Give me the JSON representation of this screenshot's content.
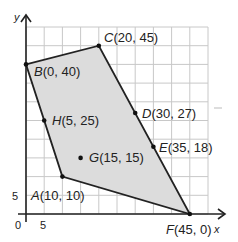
{
  "chart_data": {
    "type": "scatter",
    "title": "",
    "xlabel": "x",
    "ylabel": "y",
    "xlim": [
      0,
      50
    ],
    "ylim": [
      0,
      50
    ],
    "grid": true,
    "grid_step": 5,
    "tick_labels": {
      "x": [
        "0",
        "5"
      ],
      "y": [
        "5"
      ]
    },
    "polygon": {
      "vertices": [
        "A",
        "B",
        "C",
        "F"
      ],
      "fill": "#dcdcdc",
      "stroke": "#222222"
    },
    "points": [
      {
        "name": "A",
        "x": 10,
        "y": 10,
        "label": "A(10, 10)"
      },
      {
        "name": "B",
        "x": 0,
        "y": 40,
        "label": "B(0, 40)"
      },
      {
        "name": "C",
        "x": 20,
        "y": 45,
        "label": "C(20, 45)"
      },
      {
        "name": "D",
        "x": 30,
        "y": 27,
        "label": "D(30, 27)"
      },
      {
        "name": "E",
        "x": 35,
        "y": 18,
        "label": "E(35, 18)"
      },
      {
        "name": "F",
        "x": 45,
        "y": 0,
        "label": "F(45, 0)"
      },
      {
        "name": "G",
        "x": 15,
        "y": 15,
        "label": "G(15, 15)"
      },
      {
        "name": "H",
        "x": 5,
        "y": 25,
        "label": "H(5, 25)"
      }
    ]
  },
  "axes": {
    "x_label": "x",
    "y_label": "y",
    "origin_label": "0",
    "x_tick_5": "5",
    "y_tick_5": "5"
  },
  "labels": {
    "A": {
      "letter": "A",
      "coords": "(10, 10)"
    },
    "B": {
      "letter": "B",
      "coords": "(0, 40)"
    },
    "C": {
      "letter": "C",
      "coords": "(20, 45)"
    },
    "D": {
      "letter": "D",
      "coords": "(30, 27)"
    },
    "E": {
      "letter": "E",
      "coords": "(35, 18)"
    },
    "F": {
      "letter": "F",
      "coords": "(45, 0)"
    },
    "G": {
      "letter": "G",
      "coords": "(15, 15)"
    },
    "H": {
      "letter": "H",
      "coords": "(5, 25)"
    }
  }
}
